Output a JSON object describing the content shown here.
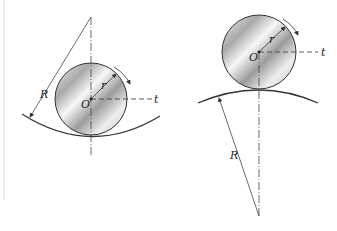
{
  "diagram": {
    "left_figure": {
      "description": "Wheel rolling inside a concave curved surface",
      "labels": {
        "radius_large": "R",
        "radius_small": "r",
        "center": "O",
        "tangent": "t"
      }
    },
    "right_figure": {
      "description": "Wheel rolling on top of a convex curved surface",
      "labels": {
        "radius_large": "R",
        "radius_small": "r",
        "center": "O",
        "tangent": "t"
      }
    },
    "colors": {
      "line": "#333333",
      "disk_light": "#f4f4f4",
      "disk_dark": "#9a9a9a",
      "border": "#d8d8d8"
    }
  }
}
